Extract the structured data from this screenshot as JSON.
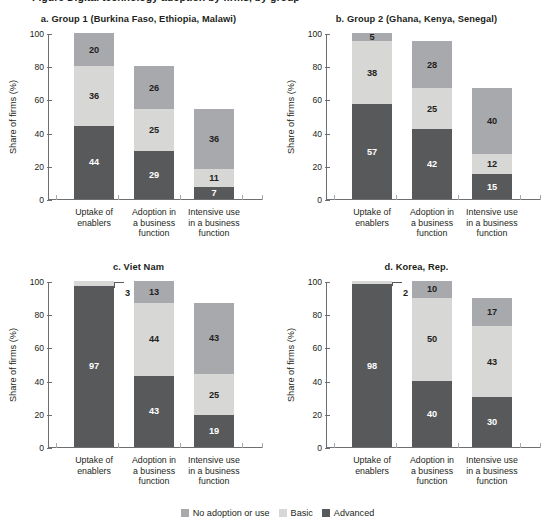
{
  "figure": {
    "clipped_header": "Figure  Digital technology adoption by firms, by group",
    "legend": [
      {
        "key": "no_adoption",
        "label": "No adoption or use",
        "color": "#a8a9ad"
      },
      {
        "key": "basic",
        "label": "Basic",
        "color": "#d7d8d6"
      },
      {
        "key": "advanced",
        "label": "Advanced",
        "color": "#58595b"
      }
    ]
  },
  "axis": {
    "ylabel": "Share of firms (%)",
    "yticks": [
      "0",
      "20",
      "40",
      "60",
      "80",
      "100"
    ],
    "categories": [
      "Uptake of\nenablers",
      "Adoption in\na business\nfunction",
      "Intensive use\nin a business\nfunction"
    ]
  },
  "chart_data": [
    {
      "type": "bar",
      "id": "a",
      "title": "a. Group 1 (Burkina Faso, Ethiopia, Malawi)",
      "categories": [
        "Uptake of enablers",
        "Adoption in a business function",
        "Intensive use in a business function"
      ],
      "series": [
        {
          "name": "Advanced",
          "values": [
            44,
            29,
            7
          ],
          "color": "#58595b"
        },
        {
          "name": "Basic",
          "values": [
            36,
            25,
            11
          ],
          "color": "#d7d8d6"
        },
        {
          "name": "No adoption or use",
          "values": [
            20,
            26,
            36
          ],
          "color": "#a8a9ad"
        }
      ],
      "totals": [
        100,
        80,
        54
      ],
      "xlabel": "",
      "ylabel": "Share of firms (%)",
      "ylim": [
        0,
        100
      ],
      "grid": false,
      "stacked": true,
      "legend_position": "bottom"
    },
    {
      "type": "bar",
      "id": "b",
      "title": "b. Group 2 (Ghana, Kenya, Senegal)",
      "categories": [
        "Uptake of enablers",
        "Adoption in a business function",
        "Intensive use in a business function"
      ],
      "series": [
        {
          "name": "Advanced",
          "values": [
            57,
            42,
            15
          ],
          "color": "#58595b"
        },
        {
          "name": "Basic",
          "values": [
            38,
            25,
            12
          ],
          "color": "#d7d8d6"
        },
        {
          "name": "No adoption or use",
          "values": [
            5,
            28,
            40
          ],
          "color": "#a8a9ad"
        }
      ],
      "totals": [
        100,
        95,
        67
      ],
      "xlabel": "",
      "ylabel": "Share of firms (%)",
      "ylim": [
        0,
        100
      ],
      "grid": false,
      "stacked": true,
      "legend_position": "bottom"
    },
    {
      "type": "bar",
      "id": "c",
      "title": "c. Viet Nam",
      "categories": [
        "Uptake of enablers",
        "Adoption in a business function",
        "Intensive use in a business function"
      ],
      "series": [
        {
          "name": "Advanced",
          "values": [
            97,
            43,
            19
          ],
          "color": "#58595b"
        },
        {
          "name": "Basic",
          "values": [
            3,
            44,
            25
          ],
          "color": "#d7d8d6"
        },
        {
          "name": "No adoption or use",
          "values": [
            0,
            13,
            43
          ],
          "color": "#a8a9ad"
        }
      ],
      "totals": [
        100,
        100,
        87
      ],
      "annotations": [
        {
          "text": "3",
          "for_category": "Uptake of enablers",
          "series": "Basic"
        }
      ],
      "xlabel": "",
      "ylabel": "Share of firms (%)",
      "ylim": [
        0,
        100
      ],
      "grid": false,
      "stacked": true,
      "legend_position": "bottom"
    },
    {
      "type": "bar",
      "id": "d",
      "title": "d. Korea, Rep.",
      "categories": [
        "Uptake of enablers",
        "Adoption in a business function",
        "Intensive use in a business function"
      ],
      "series": [
        {
          "name": "Advanced",
          "values": [
            98,
            40,
            30
          ],
          "color": "#58595b"
        },
        {
          "name": "Basic",
          "values": [
            2,
            50,
            43
          ],
          "color": "#d7d8d6"
        },
        {
          "name": "No adoption or use",
          "values": [
            0,
            10,
            17
          ],
          "color": "#a8a9ad"
        }
      ],
      "totals": [
        100,
        100,
        90
      ],
      "annotations": [
        {
          "text": "2",
          "for_category": "Uptake of enablers",
          "series": "Basic"
        }
      ],
      "xlabel": "",
      "ylabel": "Share of firms (%)",
      "ylim": [
        0,
        100
      ],
      "grid": false,
      "stacked": true,
      "legend_position": "bottom"
    }
  ]
}
